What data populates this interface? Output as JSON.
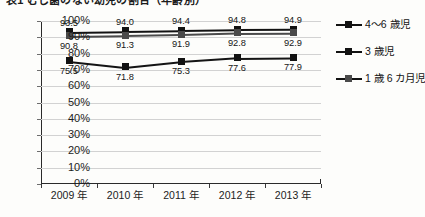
{
  "title_clipped": "表1 むし歯のない幼児の割合（年齢別）",
  "chart_data": {
    "type": "line",
    "title": "",
    "xlabel": "",
    "ylabel": "",
    "ylim": [
      0,
      100
    ],
    "ytick_step": 10,
    "grid": true,
    "legend_position": "right",
    "categories": [
      "2009 年",
      "2010 年",
      "2011 年",
      "2012 年",
      "2013 年"
    ],
    "ytick_labels": [
      "100%",
      "90%",
      "80%",
      "70%",
      "60%",
      "50%",
      "40%",
      "30%",
      "20%",
      "10%",
      "0%"
    ],
    "series": [
      {
        "name": "4〜6 歳児",
        "color": "#121212",
        "marker": "square",
        "label_position": "above",
        "values": [
          93.5,
          94.0,
          94.4,
          94.8,
          94.9
        ],
        "labels": [
          "93.5",
          "94.0",
          "94.4",
          "94.8",
          "94.9"
        ]
      },
      {
        "name": "1 歳 6 カ月児",
        "color": "#4a4a4a",
        "marker": "square",
        "label_position": "below",
        "values": [
          90.8,
          91.3,
          91.9,
          92.8,
          92.9
        ],
        "labels": [
          "90.8",
          "91.3",
          "91.9",
          "92.8",
          "92.9"
        ]
      },
      {
        "name": "3 歳児",
        "color": "#141414",
        "marker": "square",
        "label_position": "below",
        "values": [
          75.5,
          71.8,
          75.3,
          77.6,
          77.9
        ],
        "labels": [
          "75.5",
          "71.8",
          "75.3",
          "77.6",
          "77.9"
        ]
      }
    ]
  },
  "legend": {
    "items": [
      {
        "label": "4〜6 歳児"
      },
      {
        "label": "3 歳児"
      },
      {
        "label": "1 歳 6 カ月児"
      }
    ]
  }
}
